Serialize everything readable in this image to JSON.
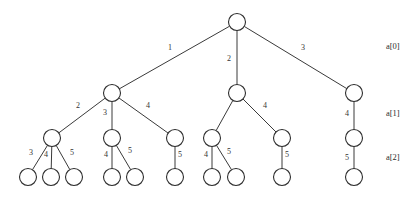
{
  "figure": {
    "type": "tree-diagram",
    "background_color": "#ffffff",
    "stroke_color": "#3a3a3a",
    "node_fill": "#ffffff",
    "text_color": "#2b2b2b",
    "width": 419,
    "height": 199
  },
  "level_labels": [
    {
      "text": "a[0]",
      "x": 386,
      "y": 46
    },
    {
      "text": "a[1]",
      "x": 386,
      "y": 113
    },
    {
      "text": "a[2]",
      "x": 386,
      "y": 157
    }
  ],
  "nodes": [
    {
      "id": "root",
      "x": 237,
      "y": 22,
      "r": 8.5,
      "level": 0
    },
    {
      "id": "n1",
      "x": 112,
      "y": 93,
      "r": 8.5,
      "level": 1
    },
    {
      "id": "n2",
      "x": 237,
      "y": 93,
      "r": 8.5,
      "level": 1
    },
    {
      "id": "n3",
      "x": 354,
      "y": 93,
      "r": 8.5,
      "level": 1
    },
    {
      "id": "n1a",
      "x": 52,
      "y": 138,
      "r": 8.5,
      "level": 2
    },
    {
      "id": "n1b",
      "x": 112,
      "y": 138,
      "r": 8.5,
      "level": 2
    },
    {
      "id": "n1c",
      "x": 175,
      "y": 138,
      "r": 8.5,
      "level": 2
    },
    {
      "id": "n2a",
      "x": 212,
      "y": 138,
      "r": 8.5,
      "level": 2
    },
    {
      "id": "n2b",
      "x": 282,
      "y": 138,
      "r": 8.5,
      "level": 2
    },
    {
      "id": "n3a",
      "x": 354,
      "y": 138,
      "r": 8.5,
      "level": 2
    },
    {
      "id": "l1",
      "x": 28,
      "y": 177,
      "r": 8.5,
      "level": 3
    },
    {
      "id": "l2",
      "x": 51,
      "y": 177,
      "r": 8.5,
      "level": 3
    },
    {
      "id": "l3",
      "x": 74,
      "y": 177,
      "r": 8.5,
      "level": 3
    },
    {
      "id": "l4",
      "x": 112,
      "y": 177,
      "r": 8.5,
      "level": 3
    },
    {
      "id": "l5",
      "x": 135,
      "y": 177,
      "r": 8.5,
      "level": 3
    },
    {
      "id": "l6",
      "x": 175,
      "y": 177,
      "r": 8.5,
      "level": 3
    },
    {
      "id": "l7",
      "x": 212,
      "y": 177,
      "r": 8.5,
      "level": 3
    },
    {
      "id": "l8",
      "x": 236,
      "y": 177,
      "r": 8.5,
      "level": 3
    },
    {
      "id": "l9",
      "x": 282,
      "y": 177,
      "r": 8.5,
      "level": 3
    },
    {
      "id": "l10",
      "x": 354,
      "y": 177,
      "r": 8.5,
      "level": 3
    }
  ],
  "edges": [
    {
      "from": "root",
      "to": "n1",
      "label": "1",
      "lx": 170,
      "ly": 48
    },
    {
      "from": "root",
      "to": "n2",
      "label": "2",
      "lx": 229,
      "ly": 59
    },
    {
      "from": "root",
      "to": "n3",
      "label": "3",
      "lx": 303,
      "ly": 48
    },
    {
      "from": "n1",
      "to": "n1a",
      "label": "2",
      "lx": 78,
      "ly": 106
    },
    {
      "from": "n1",
      "to": "n1b",
      "label": "3",
      "lx": 105,
      "ly": 113
    },
    {
      "from": "n1",
      "to": "n1c",
      "label": "4",
      "lx": 148,
      "ly": 106
    },
    {
      "from": "n2",
      "to": "n2a",
      "label": "",
      "lx": 0,
      "ly": 0
    },
    {
      "from": "n2",
      "to": "n2b",
      "label": "4",
      "lx": 265,
      "ly": 106
    },
    {
      "from": "n3",
      "to": "n3a",
      "label": "4",
      "lx": 347,
      "ly": 114
    },
    {
      "from": "n1a",
      "to": "l1",
      "label": "3",
      "lx": 31,
      "ly": 153
    },
    {
      "from": "n1a",
      "to": "l2",
      "label": "4",
      "lx": 46,
      "ly": 155
    },
    {
      "from": "n1a",
      "to": "l3",
      "label": "5",
      "lx": 72,
      "ly": 153
    },
    {
      "from": "n1b",
      "to": "l4",
      "label": "4",
      "lx": 106,
      "ly": 155
    },
    {
      "from": "n1b",
      "to": "l5",
      "label": "5",
      "lx": 130,
      "ly": 151
    },
    {
      "from": "n1c",
      "to": "l6",
      "label": "5",
      "lx": 180,
      "ly": 155
    },
    {
      "from": "n2a",
      "to": "l7",
      "label": "4",
      "lx": 206,
      "ly": 155
    },
    {
      "from": "n2a",
      "to": "l8",
      "label": "5",
      "lx": 229,
      "ly": 152
    },
    {
      "from": "n2b",
      "to": "l9",
      "label": "5",
      "lx": 287,
      "ly": 155
    },
    {
      "from": "n3a",
      "to": "l10",
      "label": "5",
      "lx": 347,
      "ly": 158
    }
  ]
}
